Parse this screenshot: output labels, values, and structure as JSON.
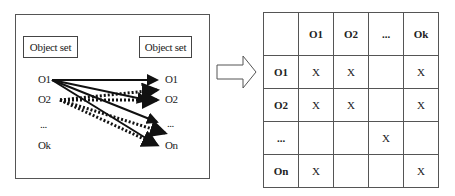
{
  "left_panel": {
    "source_set_label": "Object set",
    "target_set_label": "Object set",
    "source_objects": [
      "O1",
      "O2",
      "...",
      "Ok"
    ],
    "target_objects": [
      "O1",
      "O2",
      "...",
      "On"
    ]
  },
  "transform_arrow": "right-block-arrow",
  "matrix": {
    "corner": "",
    "columns": [
      "O1",
      "O2",
      "...",
      "Ok"
    ],
    "rows": [
      {
        "label": "O1",
        "cells": [
          "X",
          "X",
          "",
          "X"
        ]
      },
      {
        "label": "O2",
        "cells": [
          "X",
          "X",
          "",
          "X"
        ]
      },
      {
        "label": "...",
        "cells": [
          "",
          "",
          "X",
          ""
        ]
      },
      {
        "label": "On",
        "cells": [
          "X",
          "",
          "",
          "X"
        ]
      }
    ]
  }
}
